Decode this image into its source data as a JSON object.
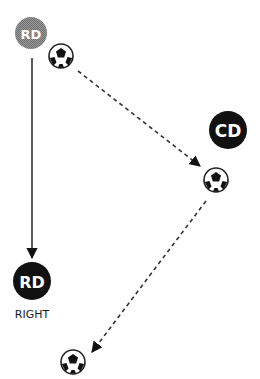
{
  "diagram": {
    "players": [
      {
        "id": "rd-start",
        "label": "RD",
        "fill": "#8a8a8a",
        "state": "starting position"
      },
      {
        "id": "cd",
        "label": "CD",
        "fill": "#111111"
      },
      {
        "id": "rd-end",
        "label": "RD",
        "fill": "#111111",
        "caption": "RIGHT"
      }
    ],
    "balls": [
      {
        "id": "ball-1"
      },
      {
        "id": "ball-2"
      },
      {
        "id": "ball-3"
      }
    ],
    "arrows": [
      {
        "id": "rd-run",
        "from": "rd-start",
        "to": "rd-end",
        "style": "solid",
        "meaning": "player movement"
      },
      {
        "id": "pass-1",
        "from": "ball-1",
        "to": "ball-2",
        "style": "dashed",
        "meaning": "pass"
      },
      {
        "id": "pass-2",
        "from": "ball-2",
        "to": "ball-3",
        "style": "dashed",
        "meaning": "pass"
      }
    ],
    "colors": {
      "ink": "#111111",
      "gray_player": "#8a8a8a",
      "background": "#ffffff"
    }
  }
}
